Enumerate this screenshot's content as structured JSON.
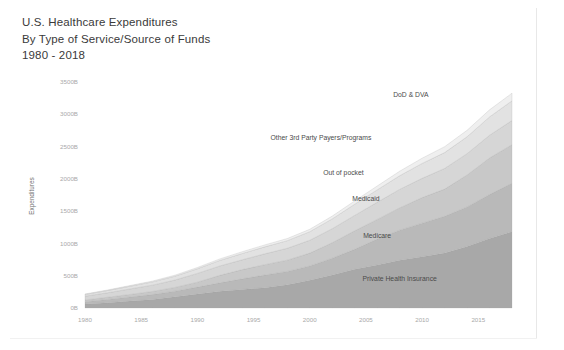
{
  "title": {
    "line1": "U.S. Healthcare Expenditures",
    "line2": "By Type of Service/Source of Funds",
    "line3": "1980 - 2018"
  },
  "chart_data": {
    "type": "area",
    "stacked": true,
    "title": "U.S. Healthcare Expenditures By Type of Service/Source of Funds 1980 - 2018",
    "xlabel": "",
    "ylabel": "Expenditures",
    "xlim": [
      1980,
      2018
    ],
    "ylim": [
      0,
      3500
    ],
    "grid": false,
    "legend_position": "inline-right",
    "y_tick_labels": [
      "3500B",
      "3000B",
      "2500B",
      "2000B",
      "1500B",
      "1000B",
      "500B",
      "0B"
    ],
    "y_ticks": [
      3500,
      3000,
      2500,
      2000,
      1500,
      1000,
      500,
      0
    ],
    "x_tick_labels": [
      "1980",
      "1985",
      "1990",
      "1995",
      "2000",
      "2005",
      "2010",
      "2015"
    ],
    "x_ticks": [
      1980,
      1985,
      1990,
      1995,
      2000,
      2005,
      2010,
      2015
    ],
    "x": [
      1980,
      1982,
      1984,
      1986,
      1988,
      1990,
      1992,
      1994,
      1996,
      1998,
      2000,
      2002,
      2004,
      2006,
      2008,
      2010,
      2012,
      2014,
      2016,
      2018
    ],
    "series": [
      {
        "name": "Private Health Insurance",
        "color": "#a8a8a8",
        "label_x": 2008,
        "label_value": 420,
        "values": [
          62,
          83,
          107,
          133,
          174,
          216,
          258,
          288,
          315,
          359,
          430,
          511,
          600,
          667,
          740,
          795,
          850,
          953,
          1078,
          1182
        ]
      },
      {
        "name": "Medicare",
        "color": "#b9b9b9",
        "label_x": 2006,
        "label_value": 1090,
        "values": [
          36,
          50,
          64,
          75,
          87,
          108,
          132,
          164,
          196,
          208,
          221,
          261,
          309,
          401,
          466,
          519,
          570,
          613,
          679,
          750
        ]
      },
      {
        "name": "Medicaid",
        "color": "#c8c8c8",
        "label_x": 2005,
        "label_value": 1660,
        "values": [
          26,
          33,
          39,
          48,
          58,
          76,
          116,
          143,
          160,
          174,
          199,
          239,
          287,
          304,
          344,
          396,
          421,
          494,
          566,
          597
        ]
      },
      {
        "name": "Out of pocket",
        "color": "#d6d6d6",
        "label_x": 2003,
        "label_value": 2055,
        "values": [
          59,
          70,
          85,
          98,
          114,
          136,
          145,
          152,
          168,
          184,
          199,
          217,
          238,
          265,
          287,
          298,
          320,
          330,
          352,
          375
        ]
      },
      {
        "name": "Other 3rd Party Payers/Programs",
        "color": "#e2e2e2",
        "label_x": 2001,
        "label_value": 2600,
        "values": [
          27,
          34,
          42,
          50,
          59,
          72,
          86,
          98,
          108,
          118,
          133,
          152,
          173,
          192,
          211,
          231,
          246,
          262,
          284,
          305
        ]
      },
      {
        "name": "DoD & DVA",
        "color": "#efefef",
        "label_x": 2009,
        "label_value": 3275,
        "values": [
          7,
          9,
          11,
          13,
          16,
          19,
          23,
          27,
          30,
          33,
          37,
          43,
          52,
          60,
          70,
          81,
          91,
          100,
          110,
          118
        ]
      }
    ]
  }
}
